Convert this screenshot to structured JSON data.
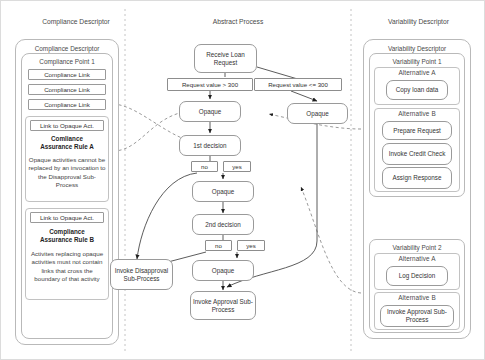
{
  "columns": [
    {
      "name": "compliance",
      "title": "Compliance Descriptor"
    },
    {
      "name": "abstract",
      "title": "Abstract Process"
    },
    {
      "name": "variability",
      "title": "Variability Descriptor"
    }
  ],
  "compliance": {
    "container_title": "Compliance Descriptor",
    "point_title": "Compliance Point 1",
    "links": [
      "Compliance Link",
      "Compliance Link",
      "Compliance Link"
    ],
    "rules": [
      {
        "link_label": "Link to Opaque Act.",
        "name": "Comliance\nAssurance Rule A",
        "name_line1": "Comliance",
        "name_line2": "Assurance Rule A",
        "text": "Opaque activities cannot be replaced by an invocation to the Disapproval Sub-Process"
      },
      {
        "link_label": "Link to Opaque Act.",
        "name_line1": "Compliance",
        "name_line2": "Assurance Rule B",
        "text": "Activites replacing opaque activities must not contain links that cross the boundary of that activity"
      }
    ]
  },
  "abstract": {
    "nodes": {
      "start": "Receive Loan Request",
      "opaque_left": "Opaque",
      "opaque_right": "Opaque",
      "decision1": "1st decision",
      "opaque_mid": "Opaque",
      "decision2": "2nd decision",
      "opaque_low": "Opaque",
      "invoke_disapproval": "Invoke Disapproval Sub-Process",
      "invoke_approval": "Invoke Approval Sub-Process"
    },
    "conditions": {
      "gt": "Request value > 300",
      "lte": "Request value <= 300"
    },
    "branch_labels": {
      "d1_no": "no",
      "d1_yes": "yes",
      "d2_no": "no",
      "d2_yes": "yes"
    }
  },
  "variability": {
    "container_title": "Variability Descriptor",
    "points": [
      {
        "title": "Variability Point 1",
        "alternatives": [
          {
            "title": "Alternative A",
            "activities": [
              "Copy loan data"
            ]
          },
          {
            "title": "Alternative B",
            "activities": [
              "Prepare Request",
              "Invoke Credit Check",
              "Assign Response"
            ]
          }
        ]
      },
      {
        "title": "Variability Point 2",
        "alternatives": [
          {
            "title": "Alternative A",
            "activities": [
              "Log Decision"
            ]
          },
          {
            "title": "Alternative B",
            "activities": [
              "Invoke Approval Sub-Process"
            ]
          }
        ]
      }
    ]
  },
  "colors": {
    "stroke": "#9a9a9a",
    "dashed": "#9a9a9a",
    "text": "#333333",
    "divider": "#c0c0c0"
  }
}
